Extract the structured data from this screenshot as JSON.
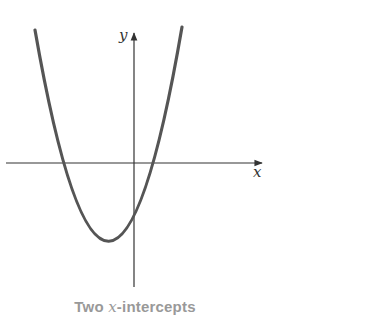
{
  "figure": {
    "x_label": "x",
    "y_label": "y",
    "caption_prefix": "Two ",
    "caption_var": "x",
    "caption_suffix": "-intercepts",
    "colors": {
      "curve": "#555555",
      "axis": "#333333",
      "caption": "#999999"
    },
    "curve": {
      "type": "parabola-upward",
      "vertex_px": [
        109,
        242
      ],
      "x_intercepts_px": [
        64,
        153
      ],
      "y_intercept_px": [
        134,
        218
      ],
      "top_left_px": [
        35,
        30
      ],
      "top_right_px": [
        182,
        27
      ]
    },
    "axes": {
      "x_axis": {
        "y": 163,
        "from": 6,
        "to": 264
      },
      "y_axis": {
        "x": 134,
        "from": 287,
        "to": 31
      }
    }
  }
}
